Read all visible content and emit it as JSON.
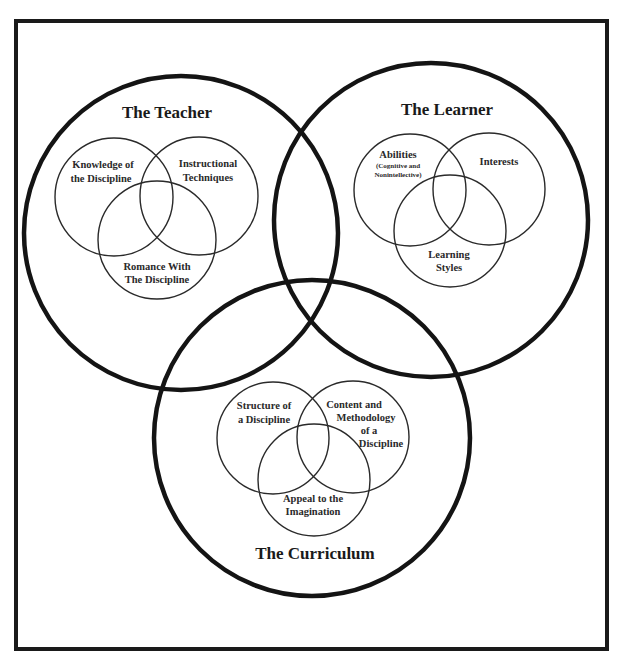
{
  "diagram": {
    "teacher": {
      "title": "The Teacher",
      "circles": [
        {
          "lines": [
            "Knowledge of",
            "the Discipline"
          ]
        },
        {
          "lines": [
            "Instructional",
            "Techniques"
          ]
        },
        {
          "lines": [
            "Romance With",
            "The Discipline"
          ]
        }
      ]
    },
    "learner": {
      "title": "The Learner",
      "circles": [
        {
          "lines": [
            "Abilities"
          ],
          "sub_lines": [
            "(Cognitive and",
            "Nonintellective)"
          ]
        },
        {
          "lines": [
            "Interests"
          ]
        },
        {
          "lines": [
            "Learning",
            "Styles"
          ]
        }
      ]
    },
    "curriculum": {
      "title": "The Curriculum",
      "circles": [
        {
          "lines": [
            "Structure of",
            "a Discipline"
          ]
        },
        {
          "lines": [
            "Content and",
            "Methodology",
            "of a",
            "Discipline"
          ]
        },
        {
          "lines": [
            "Appeal to the",
            "Imagination"
          ]
        }
      ]
    }
  }
}
